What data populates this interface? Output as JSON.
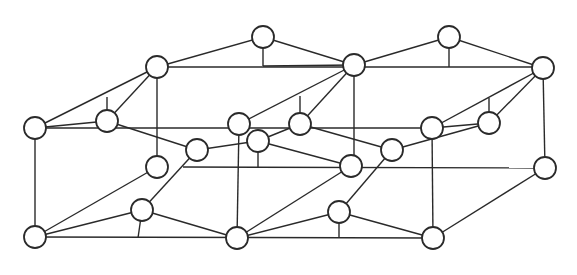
{
  "diagram": {
    "type": "graph",
    "node_radius": 11,
    "stroke_color": "#2a2a2a",
    "fill_color": "#ffffff",
    "nodes": [
      {
        "id": "n1",
        "x": 35,
        "y": 128
      },
      {
        "id": "n2",
        "x": 107,
        "y": 121
      },
      {
        "id": "n3",
        "x": 157,
        "y": 67
      },
      {
        "id": "n4",
        "x": 263,
        "y": 37
      },
      {
        "id": "n5",
        "x": 354,
        "y": 65
      },
      {
        "id": "n6",
        "x": 449,
        "y": 37
      },
      {
        "id": "n7",
        "x": 543,
        "y": 68
      },
      {
        "id": "n8",
        "x": 239,
        "y": 124
      },
      {
        "id": "n9",
        "x": 258,
        "y": 141
      },
      {
        "id": "n10",
        "x": 300,
        "y": 124
      },
      {
        "id": "n11",
        "x": 432,
        "y": 128
      },
      {
        "id": "n12",
        "x": 489,
        "y": 123
      },
      {
        "id": "n13",
        "x": 157,
        "y": 167
      },
      {
        "id": "n14",
        "x": 197,
        "y": 150
      },
      {
        "id": "n15",
        "x": 142,
        "y": 210
      },
      {
        "id": "n16",
        "x": 35,
        "y": 237
      },
      {
        "id": "n17",
        "x": 237,
        "y": 238
      },
      {
        "id": "n18",
        "x": 351,
        "y": 166
      },
      {
        "id": "n19",
        "x": 392,
        "y": 150
      },
      {
        "id": "n20",
        "x": 339,
        "y": 212
      },
      {
        "id": "n21",
        "x": 433,
        "y": 238
      },
      {
        "id": "n22",
        "x": 545,
        "y": 168
      }
    ],
    "edges": [
      {
        "x1": 35,
        "y1": 128,
        "x2": 157,
        "y2": 67
      },
      {
        "x1": 35,
        "y1": 128,
        "x2": 107,
        "y2": 121
      },
      {
        "x1": 35,
        "y1": 128,
        "x2": 432,
        "y2": 128
      },
      {
        "x1": 35,
        "y1": 128,
        "x2": 35,
        "y2": 237
      },
      {
        "x1": 107,
        "y1": 121,
        "x2": 157,
        "y2": 67
      },
      {
        "x1": 107,
        "y1": 121,
        "x2": 107,
        "y2": 97
      },
      {
        "x1": 107,
        "y1": 121,
        "x2": 197,
        "y2": 150
      },
      {
        "x1": 157,
        "y1": 67,
        "x2": 263,
        "y2": 37
      },
      {
        "x1": 157,
        "y1": 67,
        "x2": 543,
        "y2": 67
      },
      {
        "x1": 157,
        "y1": 67,
        "x2": 157,
        "y2": 167
      },
      {
        "x1": 263,
        "y1": 37,
        "x2": 263,
        "y2": 66
      },
      {
        "x1": 263,
        "y1": 37,
        "x2": 354,
        "y2": 65
      },
      {
        "x1": 263,
        "y1": 66,
        "x2": 354,
        "y2": 65
      },
      {
        "x1": 354,
        "y1": 65,
        "x2": 449,
        "y2": 37
      },
      {
        "x1": 354,
        "y1": 65,
        "x2": 239,
        "y2": 124
      },
      {
        "x1": 354,
        "y1": 65,
        "x2": 300,
        "y2": 124
      },
      {
        "x1": 300,
        "y1": 96,
        "x2": 300,
        "y2": 124
      },
      {
        "x1": 354,
        "y1": 65,
        "x2": 354,
        "y2": 166
      },
      {
        "x1": 449,
        "y1": 37,
        "x2": 449,
        "y2": 67
      },
      {
        "x1": 449,
        "y1": 37,
        "x2": 543,
        "y2": 68
      },
      {
        "x1": 543,
        "y1": 68,
        "x2": 432,
        "y2": 128
      },
      {
        "x1": 543,
        "y1": 68,
        "x2": 489,
        "y2": 123
      },
      {
        "x1": 489,
        "y1": 98,
        "x2": 489,
        "y2": 123
      },
      {
        "x1": 543,
        "y1": 68,
        "x2": 545,
        "y2": 168
      },
      {
        "x1": 432,
        "y1": 128,
        "x2": 489,
        "y2": 123
      },
      {
        "x1": 432,
        "y1": 128,
        "x2": 433,
        "y2": 238
      },
      {
        "x1": 489,
        "y1": 123,
        "x2": 392,
        "y2": 150
      },
      {
        "x1": 239,
        "y1": 124,
        "x2": 237,
        "y2": 238
      },
      {
        "x1": 258,
        "y1": 141,
        "x2": 300,
        "y2": 124
      },
      {
        "x1": 258,
        "y1": 141,
        "x2": 197,
        "y2": 150
      },
      {
        "x1": 258,
        "y1": 141,
        "x2": 258,
        "y2": 167
      },
      {
        "x1": 258,
        "y1": 141,
        "x2": 351,
        "y2": 166
      },
      {
        "x1": 300,
        "y1": 124,
        "x2": 392,
        "y2": 150
      },
      {
        "x1": 183,
        "y1": 167,
        "x2": 545,
        "y2": 168
      },
      {
        "x1": 157,
        "y1": 167,
        "x2": 35,
        "y2": 237
      },
      {
        "x1": 197,
        "y1": 150,
        "x2": 142,
        "y2": 210
      },
      {
        "x1": 142,
        "y1": 210,
        "x2": 35,
        "y2": 237
      },
      {
        "x1": 142,
        "y1": 210,
        "x2": 138,
        "y2": 238
      },
      {
        "x1": 142,
        "y1": 210,
        "x2": 237,
        "y2": 238
      },
      {
        "x1": 35,
        "y1": 237,
        "x2": 433,
        "y2": 238
      },
      {
        "x1": 237,
        "y1": 238,
        "x2": 351,
        "y2": 166
      },
      {
        "x1": 237,
        "y1": 238,
        "x2": 339,
        "y2": 212
      },
      {
        "x1": 339,
        "y1": 212,
        "x2": 392,
        "y2": 150
      },
      {
        "x1": 339,
        "y1": 212,
        "x2": 339,
        "y2": 238
      },
      {
        "x1": 339,
        "y1": 212,
        "x2": 433,
        "y2": 238
      },
      {
        "x1": 433,
        "y1": 238,
        "x2": 545,
        "y2": 168
      }
    ]
  }
}
